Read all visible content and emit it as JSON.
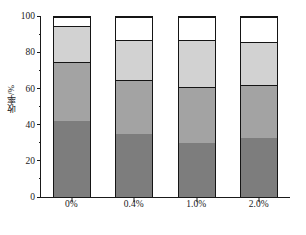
{
  "chart_data": {
    "type": "bar",
    "subtype": "stacked-bar",
    "title": "",
    "xlabel": "",
    "ylabel": "收率/%",
    "ylim": [
      0,
      100
    ],
    "yticks": [
      0,
      20,
      40,
      60,
      80,
      100
    ],
    "ytick_labels": [
      "0",
      "20",
      "40",
      "60",
      "80",
      "100"
    ],
    "y_minor_ticks": [
      10,
      30,
      50,
      70,
      90
    ],
    "grid": false,
    "legend": "none",
    "categories": [
      "0%",
      "0.4%",
      "1.0%",
      "2.0%"
    ],
    "series": [
      {
        "name": "segment-1",
        "color": "#7d7d7d",
        "values": [
          42,
          35,
          30,
          33
        ]
      },
      {
        "name": "segment-2",
        "color": "#a3a3a3",
        "values": [
          33,
          30,
          31,
          29
        ]
      },
      {
        "name": "segment-3",
        "color": "#d2d2d2",
        "values": [
          20,
          22,
          26,
          24
        ]
      },
      {
        "name": "segment-4",
        "color": "#ffffff",
        "values": [
          5,
          13,
          13,
          14
        ]
      }
    ],
    "cumulative_boundaries": [
      [
        42,
        75,
        95,
        100
      ],
      [
        35,
        65,
        87,
        100
      ],
      [
        30,
        61,
        87,
        100
      ],
      [
        33,
        62,
        86,
        100
      ]
    ]
  },
  "axis": {
    "y_title": "收率/%",
    "tick_100": "100",
    "tick_80": "80",
    "tick_60": "60",
    "tick_40": "40",
    "tick_20": "20",
    "tick_0": "0"
  },
  "xaxis": {
    "label_0": "0%",
    "label_1": "0.4%",
    "label_2": "1.0%",
    "label_3": "2.0%"
  },
  "colors": {
    "axis": "#1a1a1a",
    "seg1": "#7d7d7d",
    "seg2": "#a3a3a3",
    "seg3": "#d2d2d2",
    "seg4": "#ffffff",
    "background": "#ffffff"
  }
}
